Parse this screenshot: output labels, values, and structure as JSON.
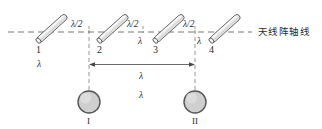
{
  "figure": {
    "title_text": "",
    "axis_label": "天线阵轴线",
    "colors": {
      "line": "#555555",
      "dash": "#777777",
      "tube_fill": "#e8e8e8",
      "tube_stroke": "#4a4a4a",
      "circle_fill": "#cfcfcf",
      "circle_stroke": "#555555",
      "text": "#2b2b2b"
    },
    "antennas": [
      {
        "id": "1",
        "label": "1",
        "spacing_label_right": "λ/2"
      },
      {
        "id": "2",
        "label": "2",
        "spacing_label_right": "λ/2"
      },
      {
        "id": "3",
        "label": "3",
        "spacing_label_right": "λ/2"
      },
      {
        "id": "4",
        "label": "4",
        "spacing_label_right": ""
      }
    ],
    "spacing_labels": [
      {
        "name": "gap-1-2",
        "text": "λ/2"
      },
      {
        "name": "gap-2-3",
        "text": "λ/2"
      },
      {
        "name": "gap-3-4",
        "text": "λ/2"
      }
    ],
    "feed_labels": [
      {
        "name": "feed-lambda-1",
        "text": "λ"
      },
      {
        "name": "feed-lambda-2",
        "text": "λ"
      },
      {
        "name": "feed-lambda-3",
        "text": "λ"
      }
    ],
    "dimension": {
      "name": "span-I-II",
      "text": "λ",
      "secondary_text": "λ"
    },
    "sources": [
      {
        "id": "I",
        "label": "I"
      },
      {
        "id": "II",
        "label": "II"
      }
    ]
  }
}
